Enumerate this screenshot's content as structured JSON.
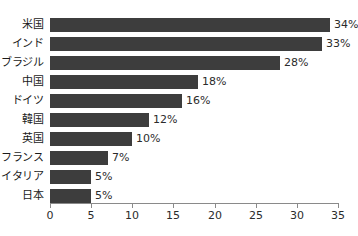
{
  "chart_data": {
    "type": "bar",
    "orientation": "horizontal",
    "title": "",
    "xlabel": "",
    "ylabel": "",
    "categories": [
      "米国",
      "インド",
      "ブラジル",
      "中国",
      "ドイツ",
      "韓国",
      "英国",
      "フランス",
      "イタリア",
      "日本"
    ],
    "values": [
      34,
      33,
      28,
      18,
      16,
      12,
      10,
      7,
      5,
      5
    ],
    "value_labels": [
      "34%",
      "33%",
      "28%",
      "18%",
      "16%",
      "12%",
      "10%",
      "7%",
      "5%",
      "5%"
    ],
    "xlim": [
      0,
      35
    ],
    "xticks": [
      0,
      5,
      10,
      15,
      20,
      25,
      30,
      35
    ],
    "xtick_labels": [
      "0",
      "5",
      "10",
      "15",
      "20",
      "25",
      "30",
      "35"
    ],
    "grid": false,
    "legend": null,
    "bar_color": "#3d3d3d",
    "axis_color": "#8a8a8a",
    "text_color": "#1a1a1a",
    "background": "#ffffff"
  }
}
